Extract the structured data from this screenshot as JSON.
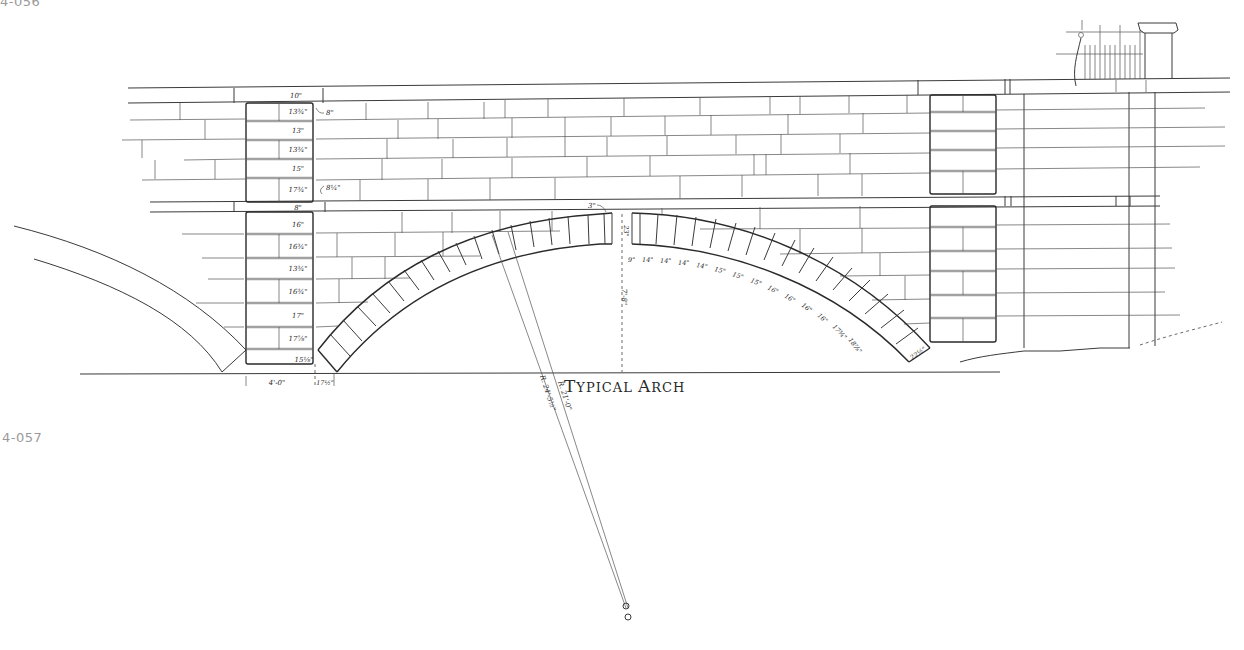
{
  "plates": {
    "top_id": "4-056",
    "bottom_id": "4-057"
  },
  "drawing": {
    "title": "Typical Arch",
    "title_parts": {
      "t1": "T",
      "r1": "YPICAL ",
      "a": "A",
      "r2": "RCH"
    },
    "type": "elevation",
    "colors": {
      "line": "#3a3a3a",
      "plate_id": "#9a9a9a",
      "background": "#ffffff"
    },
    "pier_left": {
      "course_heights_upper": [
        "10\"",
        "13¾\"",
        "13\"",
        "13¾\"",
        "15\"",
        "17¾\""
      ],
      "belt_course": "8\"",
      "course_heights_lower": [
        "16\"",
        "16¾\"",
        "13¾\"",
        "16¾\"",
        "17\"",
        "17⅞\"",
        "15⅛\""
      ],
      "callouts": [
        "8\"",
        "8¼\""
      ],
      "width_dim": "4'-0\"",
      "skewback_dim": "17½\""
    },
    "arch": {
      "crown_joint": "3\"",
      "crown_depth": "23\"",
      "rise": "7'-8\"",
      "voussoir_widths": [
        "9\"",
        "14\"",
        "14\"",
        "14\"",
        "14\"",
        "15\"",
        "15\"",
        "15\"",
        "16\"",
        "16\"",
        "16\"",
        "16\"",
        "17¾\"",
        "18⅞\""
      ],
      "springer_depth": "22½\"",
      "radius_intrados": "R. 21'-0\"",
      "radius_extrados": "R. 24'-5½\""
    }
  }
}
